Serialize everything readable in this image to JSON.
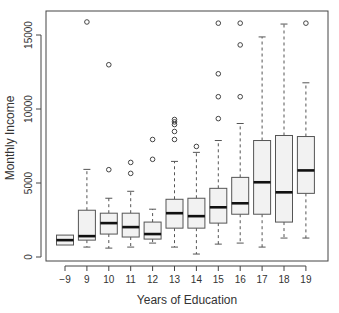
{
  "chart_data": {
    "type": "box",
    "title": "",
    "xlabel": "Years of Education",
    "ylabel": "Monthly Income",
    "ylim": [
      0,
      16500
    ],
    "yticks": [
      0,
      5000,
      10000,
      15000
    ],
    "ytick_labels": [
      "0",
      "5000",
      "10000",
      "15000"
    ],
    "grid": false,
    "legend": null,
    "categories": [
      "-9",
      "9",
      "10",
      "11",
      "12",
      "13",
      "14",
      "15",
      "16",
      "17",
      "18",
      "19"
    ],
    "boxes": [
      {
        "category": "-9",
        "whisker_low": 810,
        "q1": 810,
        "median": 1140,
        "q3": 1480,
        "whisker_high": 1480,
        "outliers": []
      },
      {
        "category": "9",
        "whisker_low": 670,
        "q1": 1140,
        "median": 1410,
        "q3": 3160,
        "whisker_high": 5920,
        "outliers": [
          15880
        ]
      },
      {
        "category": "10",
        "whisker_low": 600,
        "q1": 1550,
        "median": 2290,
        "q3": 2960,
        "whisker_high": 3970,
        "outliers": [
          5900,
          12990
        ]
      },
      {
        "category": "11",
        "whisker_low": 670,
        "q1": 1350,
        "median": 2020,
        "q3": 2960,
        "whisker_high": 4440,
        "outliers": [
          5650,
          6390
        ]
      },
      {
        "category": "12",
        "whisker_low": 940,
        "q1": 1210,
        "median": 1550,
        "q3": 2360,
        "whisker_high": 3230,
        "outliers": [
          6600,
          7940
        ]
      },
      {
        "category": "13",
        "whisker_low": 670,
        "q1": 1950,
        "median": 2960,
        "q3": 3900,
        "whisker_high": 6460,
        "outliers": [
          7940,
          8480,
          8950,
          9130,
          9290
        ]
      },
      {
        "category": "14",
        "whisker_low": 200,
        "q1": 1950,
        "median": 2760,
        "q3": 3970,
        "whisker_high": 7070,
        "outliers": [
          7470
        ]
      },
      {
        "category": "15",
        "whisker_low": 870,
        "q1": 2290,
        "median": 3360,
        "q3": 4640,
        "whisker_high": 7870,
        "outliers": [
          9350,
          10830,
          12380,
          15800
        ]
      },
      {
        "category": "16",
        "whisker_low": 940,
        "q1": 2890,
        "median": 3630,
        "q3": 5380,
        "whisker_high": 9020,
        "outliers": [
          10830,
          14330,
          15800
        ]
      },
      {
        "category": "17",
        "whisker_low": 670,
        "q1": 2890,
        "median": 5050,
        "q3": 7870,
        "whisker_high": 14870,
        "outliers": []
      },
      {
        "category": "18",
        "whisker_low": 1280,
        "q1": 2360,
        "median": 4370,
        "q3": 8210,
        "whisker_high": 15740,
        "outliers": []
      },
      {
        "category": "19",
        "whisker_low": 1280,
        "q1": 4300,
        "median": 5850,
        "q3": 8140,
        "whisker_high": 11770,
        "outliers": [
          15800
        ]
      }
    ],
    "colors": {
      "box_fill": "#f2f2f2",
      "box_stroke": "#555555",
      "median": "#111111",
      "whisker": "#555555",
      "axis": "#444444"
    }
  }
}
